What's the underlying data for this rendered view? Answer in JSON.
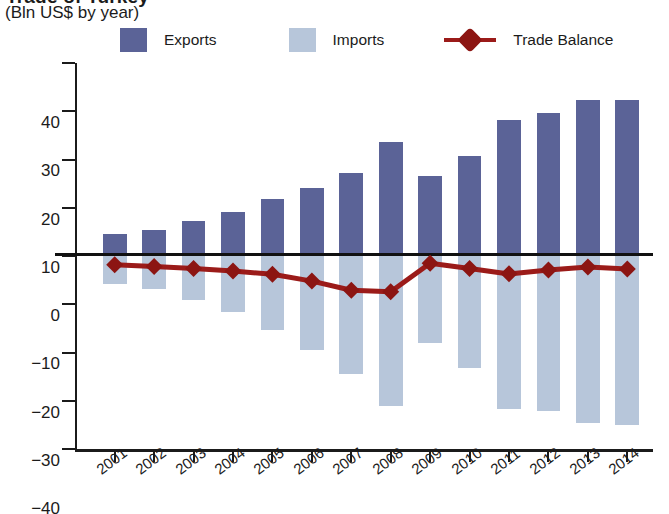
{
  "header": {
    "title_partial": "Trade of Turkey",
    "subtitle": "(Bln US$ by year)"
  },
  "legend": {
    "items": [
      {
        "label": "Exports",
        "color": "#5b6397",
        "marker": "square"
      },
      {
        "label": "Imports",
        "color": "#b7c6da",
        "marker": "square"
      },
      {
        "label": "Trade Balance",
        "color": "#9b1b19",
        "marker": "line-dot"
      }
    ]
  },
  "chart_data": {
    "type": "bar",
    "title": "(Bln US$ by year)",
    "xlabel": "",
    "ylabel": "",
    "ylim": [
      -40,
      40
    ],
    "yticks": [
      40,
      30,
      20,
      10,
      0,
      -10,
      -20,
      -30,
      -40
    ],
    "ytick_labels": [
      "40",
      "30",
      "20",
      "10",
      "0",
      "−10",
      "−20",
      "−30",
      "−40"
    ],
    "grid": false,
    "legend_position": "top",
    "categories": [
      "2001",
      "2002",
      "2003",
      "2004",
      "2005",
      "2006",
      "2007",
      "2008",
      "2009",
      "2010",
      "2011",
      "2012",
      "2013",
      "2014"
    ],
    "series": [
      {
        "name": "Exports",
        "type": "bar",
        "color": "#5b6397",
        "values": [
          4.5,
          5.4,
          7.2,
          9.2,
          11.9,
          14.1,
          17.2,
          23.6,
          16.6,
          20.7,
          28.1,
          29.6,
          32.4,
          32.3
        ]
      },
      {
        "name": "Imports",
        "type": "bar",
        "color": "#b7c6da",
        "values": [
          -5.9,
          -6.9,
          -9.2,
          -11.6,
          -15.4,
          -19.4,
          -24.4,
          -31.0,
          -18.0,
          -23.3,
          -31.8,
          -32.2,
          -34.7,
          -35.0
        ]
      },
      {
        "name": "Trade Balance",
        "type": "line",
        "color": "#9b1b19",
        "values": [
          -1.8,
          -2.2,
          -2.6,
          -3.1,
          -3.8,
          -5.2,
          -7.1,
          -7.4,
          -1.5,
          -2.6,
          -3.7,
          -2.9,
          -2.3,
          -2.7
        ]
      }
    ]
  }
}
